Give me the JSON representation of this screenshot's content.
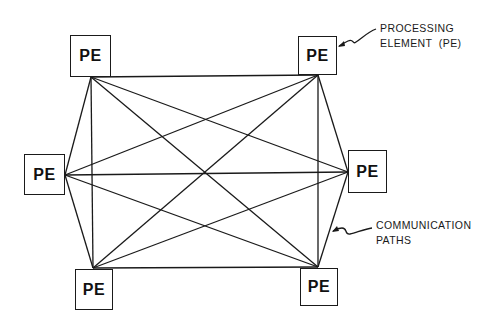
{
  "diagram": {
    "type": "fully-connected network",
    "node_label": "PE",
    "nodes": [
      {
        "id": "pe-top-left",
        "label": "PE",
        "box": [
          70,
          35,
          41,
          42
        ],
        "port": [
          91,
          77
        ]
      },
      {
        "id": "pe-left",
        "label": "PE",
        "box": [
          24,
          154,
          41,
          41
        ],
        "port": [
          65,
          175
        ]
      },
      {
        "id": "pe-bottom-left",
        "label": "PE",
        "box": [
          75,
          269,
          38,
          41
        ],
        "port": [
          93,
          268
        ]
      },
      {
        "id": "pe-top-right",
        "label": "PE",
        "box": [
          298,
          36,
          39,
          39
        ],
        "port": [
          318,
          75
        ]
      },
      {
        "id": "pe-right",
        "label": "PE",
        "box": [
          348,
          150,
          39,
          43
        ],
        "port": [
          348,
          172
        ]
      },
      {
        "id": "pe-bottom-right",
        "label": "PE",
        "box": [
          300,
          268,
          38,
          38
        ],
        "port": [
          318,
          267
        ]
      }
    ],
    "edges": "all pairs (complete graph K6, 15 edges)",
    "annotations": [
      {
        "id": "processing-element",
        "lines": [
          "PROCESSING",
          "ELEMENT  (PE)"
        ],
        "points_to": "pe-top-right"
      },
      {
        "id": "communication-paths",
        "lines": [
          "COMMUNICATION",
          "PATHS"
        ],
        "points_to": "edge pe-right to pe-bottom-right"
      }
    ],
    "colors": {
      "line": "#1a1a1a",
      "background": "#ffffff"
    }
  }
}
